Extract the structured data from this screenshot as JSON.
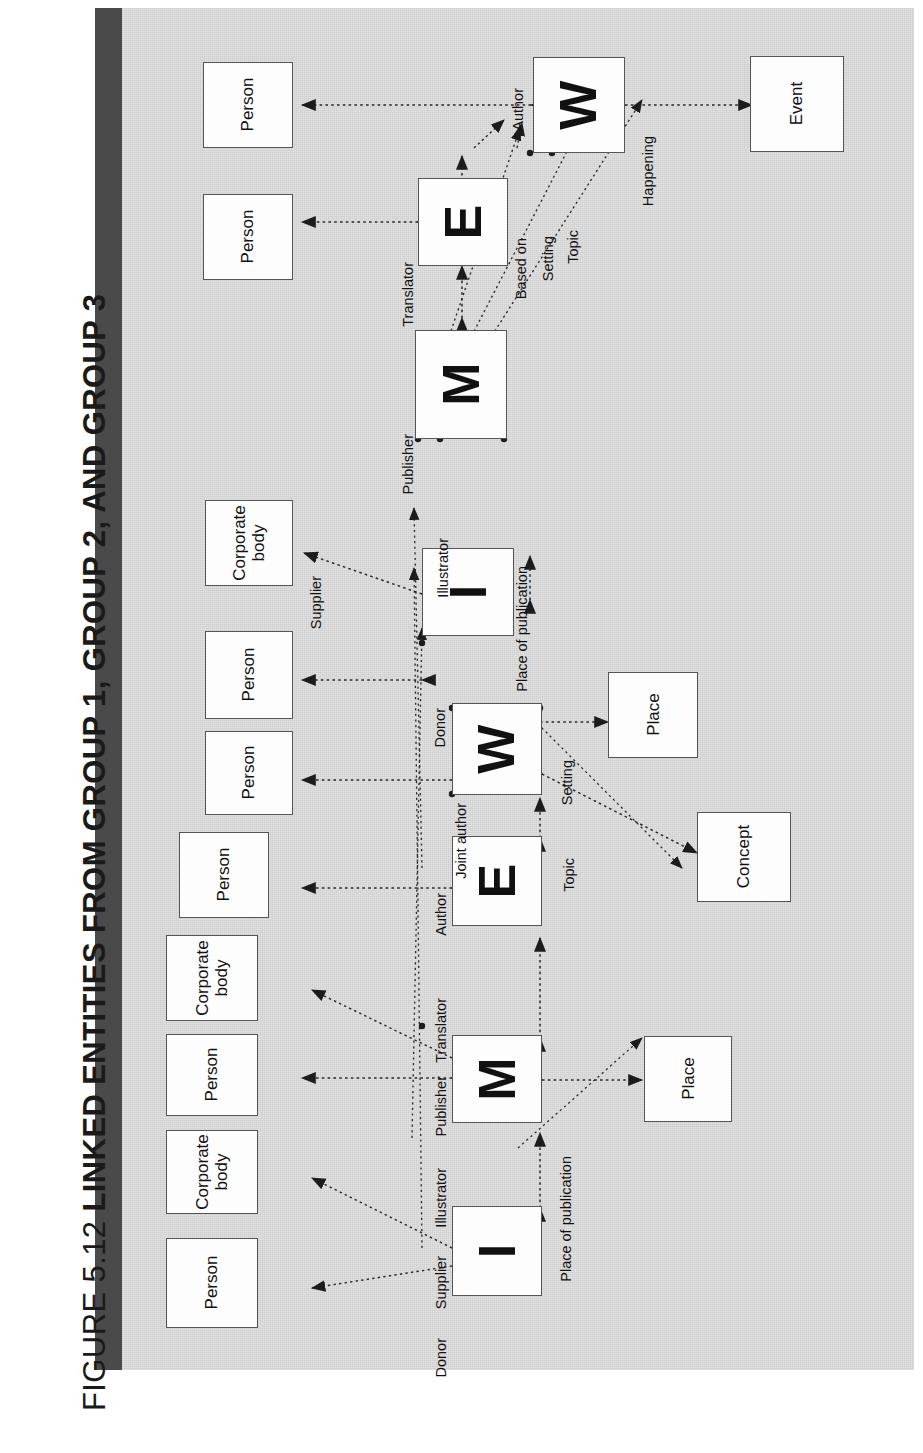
{
  "figure": {
    "number": "FIGURE 5.12",
    "title": "LINKED ENTITIES FROM GROUP 1, GROUP 2, AND GROUP 3"
  },
  "colors": {
    "panel_background": "#d8d8d8",
    "rule": "#4a4a4a",
    "node_fill": "#fdfdfd",
    "node_stroke": "#555555",
    "ink": "#111111"
  },
  "diagram": {
    "type": "entity-relationship",
    "nodes": [
      {
        "id": "g1-person-a",
        "label": "Person",
        "group": 1
      },
      {
        "id": "g1-person-b",
        "label": "Person",
        "group": 1
      },
      {
        "id": "g1-w",
        "label": "W",
        "group": 1,
        "kind": "entity-letter"
      },
      {
        "id": "g1-e",
        "label": "E",
        "group": 1,
        "kind": "entity-letter"
      },
      {
        "id": "g1-m",
        "label": "M",
        "group": 1,
        "kind": "entity-letter"
      },
      {
        "id": "g1-event",
        "label": "Event",
        "group": 1
      },
      {
        "id": "g2-corp-a",
        "label": "Corporate\nbody",
        "group": 2
      },
      {
        "id": "g2-person-a",
        "label": "Person",
        "group": 2
      },
      {
        "id": "g2-person-b",
        "label": "Person",
        "group": 2
      },
      {
        "id": "g2-person-c",
        "label": "Person",
        "group": 2
      },
      {
        "id": "g2-i",
        "label": "I",
        "group": 2,
        "kind": "entity-letter"
      },
      {
        "id": "g2-w",
        "label": "W",
        "group": 2,
        "kind": "entity-letter"
      },
      {
        "id": "g2-e",
        "label": "E",
        "group": 2,
        "kind": "entity-letter"
      },
      {
        "id": "g2-place",
        "label": "Place",
        "group": 2
      },
      {
        "id": "g2-concept",
        "label": "Concept",
        "group": 2
      },
      {
        "id": "g3-corp-a",
        "label": "Corporate\nbody",
        "group": 3
      },
      {
        "id": "g3-person-a",
        "label": "Person",
        "group": 3
      },
      {
        "id": "g3-corp-b",
        "label": "Corporate\nbody",
        "group": 3
      },
      {
        "id": "g3-person-b",
        "label": "Person",
        "group": 3
      },
      {
        "id": "g3-m",
        "label": "M",
        "group": 3,
        "kind": "entity-letter"
      },
      {
        "id": "g3-i",
        "label": "I",
        "group": 3,
        "kind": "entity-letter"
      },
      {
        "id": "g3-place",
        "label": "Place",
        "group": 3
      }
    ],
    "edge_labels": [
      {
        "id": "l-author-1",
        "text": "Author"
      },
      {
        "id": "l-happening",
        "text": "Happening"
      },
      {
        "id": "l-based-on",
        "text": "Based on"
      },
      {
        "id": "l-setting-1",
        "text": "Setting"
      },
      {
        "id": "l-topic-1",
        "text": "Topic"
      },
      {
        "id": "l-translator-1",
        "text": "Translator"
      },
      {
        "id": "l-publisher-1",
        "text": "Publisher"
      },
      {
        "id": "l-place-pub-1",
        "text": "Place of publication"
      },
      {
        "id": "l-illustrator-1",
        "text": "Illustrator"
      },
      {
        "id": "l-supplier-1",
        "text": "Supplier"
      },
      {
        "id": "l-donor-1",
        "text": "Donor"
      },
      {
        "id": "l-joint-author",
        "text": "Joint author"
      },
      {
        "id": "l-author-2",
        "text": "Author"
      },
      {
        "id": "l-setting-2",
        "text": "Setting"
      },
      {
        "id": "l-topic-2",
        "text": "Topic"
      },
      {
        "id": "l-translator-2",
        "text": "Translator"
      },
      {
        "id": "l-publisher-2",
        "text": "Publisher"
      },
      {
        "id": "l-illustrator-2",
        "text": "Illustrator"
      },
      {
        "id": "l-supplier-2",
        "text": "Supplier"
      },
      {
        "id": "l-donor-2",
        "text": "Donor"
      },
      {
        "id": "l-place-pub-2",
        "text": "Place of publication"
      }
    ]
  }
}
